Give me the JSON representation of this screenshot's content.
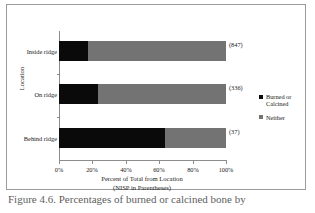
{
  "figure": {
    "border_color": "#9a9a9a"
  },
  "chart_data": {
    "type": "bar",
    "orientation": "horizontal",
    "stacked": true,
    "normalized_percent": true,
    "title": "",
    "xlabel": "Percent of Total from Location",
    "xlabel_line2": "(NISP in Parentheses)",
    "ylabel": "Location",
    "categories": [
      "Inside ridge",
      "On ridge",
      "Behind ridge"
    ],
    "category_annotations": [
      "(847)",
      "(336)",
      "(37)"
    ],
    "nisp": [
      847,
      336,
      37
    ],
    "series": [
      {
        "name": "Burned or Calcined",
        "color": "#0a0a0a",
        "values": [
          17.4,
          23.4,
          63.5
        ]
      },
      {
        "name": "Neither",
        "color": "#737373",
        "values": [
          82.6,
          76.6,
          36.5
        ]
      }
    ],
    "xlim": [
      0,
      100
    ],
    "xticks": [
      0,
      20,
      40,
      60,
      80,
      100
    ],
    "xtick_labels": [
      "0%",
      "20%",
      "40%",
      "60%",
      "80%",
      "100%"
    ],
    "grid": false,
    "legend_position": "right"
  },
  "legend": {
    "entries": [
      {
        "label": "Burned or Calcined",
        "color": "#0a0a0a"
      },
      {
        "label": "Neither",
        "color": "#737373"
      }
    ]
  },
  "page": {
    "caption": "Figure 4.6.  Percentages of burned or calcined bone by"
  }
}
